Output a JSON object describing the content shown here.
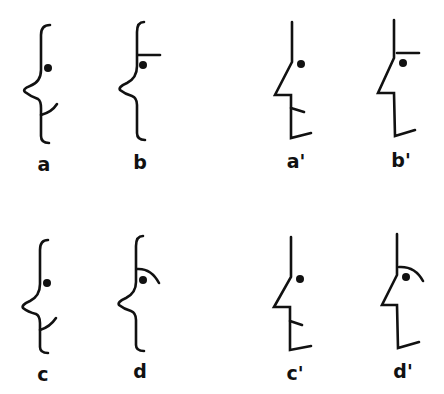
{
  "figure": {
    "colors": {
      "line": "#111111",
      "background": "#ffffff"
    },
    "panels": [
      {
        "id": "a",
        "label": "a",
        "style": "curved",
        "feature": "mouth-curve"
      },
      {
        "id": "b",
        "label": "b",
        "style": "curved",
        "feature": "straight-brow"
      },
      {
        "id": "a2",
        "label": "a'",
        "style": "angular",
        "feature": "mouth-tick"
      },
      {
        "id": "b2",
        "label": "b'",
        "style": "angular",
        "feature": "straight-brow"
      },
      {
        "id": "c",
        "label": "c",
        "style": "curved",
        "feature": "mouth-curve"
      },
      {
        "id": "d",
        "label": "d",
        "style": "curved",
        "feature": "arched-brow"
      },
      {
        "id": "c2",
        "label": "c'",
        "style": "angular",
        "feature": "mouth-tick"
      },
      {
        "id": "d2",
        "label": "d'",
        "style": "angular",
        "feature": "arched-brow"
      }
    ]
  }
}
